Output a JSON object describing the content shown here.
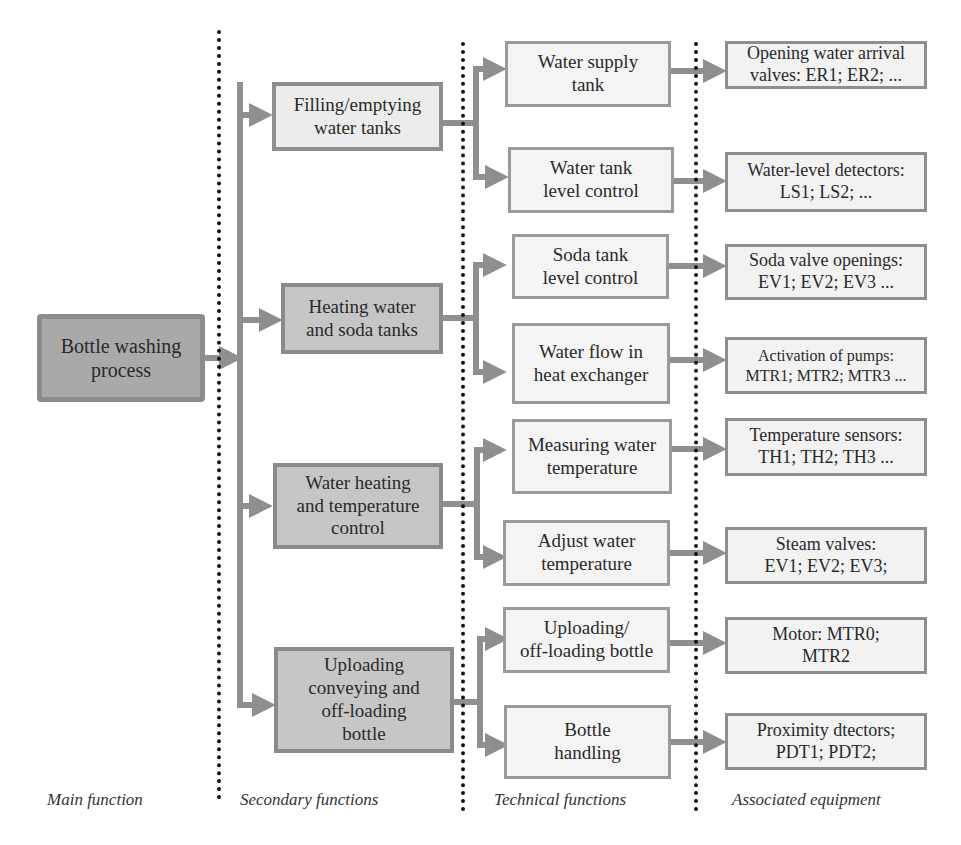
{
  "diagram": {
    "colors": {
      "connector": "#8f8f8f",
      "main_fill": "#a9a9a9",
      "secondary_fill": "#c6c6c6",
      "box_fill": "#f4f4f4",
      "divider": "#111111"
    },
    "column_labels": {
      "main": "Main function",
      "secondary": "Secondary functions",
      "technical": "Technical functions",
      "equipment": "Associated equipment"
    },
    "main_function": "Bottle washing\nprocess",
    "secondary_functions": [
      {
        "label": "Filling/emptying\nwater tanks"
      },
      {
        "label": "Heating water\nand soda tanks"
      },
      {
        "label": "Water heating\nand temperature\ncontrol"
      },
      {
        "label": "Uploading\nconveying and\noff-loading\nbottle"
      }
    ],
    "technical_functions": [
      {
        "label": "Water supply\ntank"
      },
      {
        "label": "Water tank\nlevel control"
      },
      {
        "label": "Soda tank\nlevel control"
      },
      {
        "label": "Water flow in\nheat exchanger"
      },
      {
        "label": "Measuring water\ntemperature"
      },
      {
        "label": "Adjust water\ntemperature"
      },
      {
        "label": "Uploading/\noff-loading bottle"
      },
      {
        "label": "Bottle\nhandling"
      }
    ],
    "equipment": [
      {
        "label": "Opening water arrival\nvalves: ER1; ER2; ..."
      },
      {
        "label": "Water-level detectors:\nLS1; LS2; ..."
      },
      {
        "label": "Soda valve openings:\nEV1; EV2; EV3 ..."
      },
      {
        "label": "Activation of pumps:\nMTR1; MTR2; MTR3 ..."
      },
      {
        "label": "Temperature sensors:\nTH1; TH2; TH3 ..."
      },
      {
        "label": "Steam valves:\nEV1; EV2; EV3;"
      },
      {
        "label": "Motor: MTR0;\nMTR2"
      },
      {
        "label": "Proximity dtectors;\nPDT1; PDT2;"
      }
    ]
  }
}
